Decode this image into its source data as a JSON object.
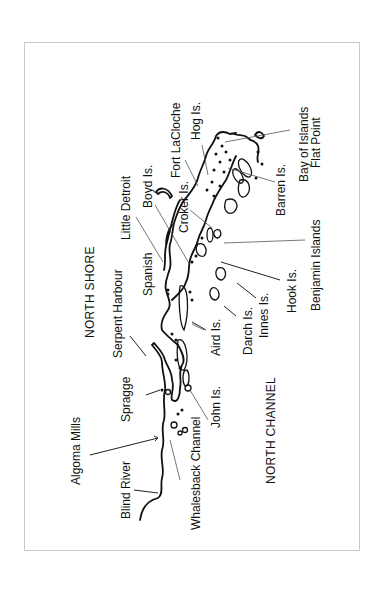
{
  "map": {
    "orientation": "rotated -90 degrees (text reads bottom-to-top)",
    "regions": {
      "north_shore": "NORTH SHORE",
      "north_channel": "NORTH CHANNEL"
    },
    "labels": {
      "blind_river": "Blind River",
      "algoma_mills": "Algoma Mills",
      "spragge": "Spragge",
      "serpent_harbour": "Serpent Harbour",
      "spanish": "Spanish",
      "little_detroit": "Little Detroit",
      "boyd_is": "Boyd Is.",
      "croker_is": "Croker Is.",
      "fort_lacloche": "Fort LaCloche",
      "hog_is": "Hog  Is.",
      "bay_of_islands": "Bay of Islands",
      "flat_point": "Flat Point",
      "barren_is": "Barren Is.",
      "benjamin_islands": "Benjamin Islands",
      "hook_is": "Hook Is.",
      "innes_is": "Innes Is.",
      "darch_is": "Darch  Is.",
      "aird_is": "Aird Is.",
      "john_is": "John Is.",
      "whalesback_channel": "Whalesback Channel"
    },
    "colors": {
      "ink": "#111111",
      "frame": "#c8c8c8",
      "background": "#ffffff"
    }
  }
}
